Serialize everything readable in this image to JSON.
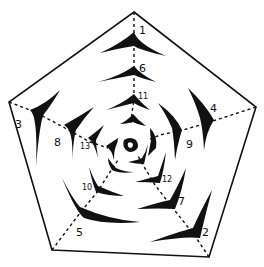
{
  "diagram": {
    "colors": {
      "ink": "#111111",
      "background": "#ffffff"
    },
    "pentagon": {
      "vertices": [
        [
          134,
          12
        ],
        [
          256,
          107
        ],
        [
          209,
          257
        ],
        [
          52,
          250
        ],
        [
          9,
          102
        ]
      ]
    },
    "nodes": [
      {
        "id": "1",
        "label": "1",
        "spoke": "top"
      },
      {
        "id": "2",
        "label": "2",
        "spoke": "bottom-right"
      },
      {
        "id": "3",
        "label": "3",
        "spoke": "left"
      },
      {
        "id": "4",
        "label": "4",
        "spoke": "right"
      },
      {
        "id": "5",
        "label": "5",
        "spoke": "bottom-left"
      },
      {
        "id": "6",
        "label": "6",
        "spoke": "top"
      },
      {
        "id": "7",
        "label": "7",
        "spoke": "bottom-right"
      },
      {
        "id": "8",
        "label": "8",
        "spoke": "left"
      },
      {
        "id": "9",
        "label": "9",
        "spoke": "right"
      },
      {
        "id": "10",
        "label": "10",
        "spoke": "bottom-left"
      },
      {
        "id": "11",
        "label": "11",
        "spoke": "top"
      },
      {
        "id": "12",
        "label": "12",
        "spoke": "bottom-right"
      },
      {
        "id": "13",
        "label": "13",
        "spoke": "left"
      }
    ]
  }
}
